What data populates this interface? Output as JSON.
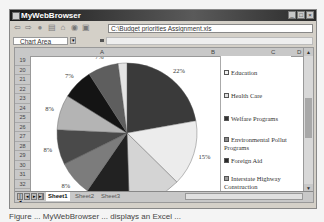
{
  "window": {
    "title": "MyWebBrowser",
    "minimize": "_",
    "maximize": "□",
    "close": "×"
  },
  "toolbar": {
    "icons": [
      "back-icon",
      "forward-icon",
      "stop-icon",
      "refresh-icon",
      "home-icon",
      "search-icon",
      "print-icon"
    ],
    "address": "C:\\Budget priorities Assignment.xls"
  },
  "formula_bar": {
    "name_box": "Chart Area",
    "formula": ""
  },
  "sheet": {
    "columns": [
      "A",
      "B",
      "C",
      "D"
    ],
    "rows": [
      "19",
      "20",
      "21",
      "22",
      "23",
      "24",
      "25",
      "26",
      "27",
      "28",
      "29",
      "30",
      "31",
      "32",
      "33",
      "34",
      "35"
    ],
    "tabs": [
      "Sheet1",
      "Sheet2",
      "Sheet3"
    ],
    "active_tab": "Sheet1"
  },
  "chart_data": {
    "type": "pie",
    "title": "",
    "slices": [
      {
        "label": "Education",
        "value": 22,
        "color": "#3a3a3a"
      },
      {
        "label": "Health Care",
        "value": 15,
        "color": "#ececec"
      },
      {
        "label": "Welfare Programs",
        "value": 12,
        "color": "#d4d4d4"
      },
      {
        "label": "Environmental Pollution Programs",
        "value": 10,
        "color": "#222222"
      },
      {
        "label": "Foreign Aid",
        "value": 8,
        "color": "#7c7c7c"
      },
      {
        "label": "Interstate Highway Construction",
        "value": 8,
        "color": "#4a4a4a"
      },
      {
        "label": "Space Research and Development",
        "value": 8,
        "color": "#b4b4b4"
      },
      {
        "label": "Other A",
        "value": 7,
        "color": "#141414"
      },
      {
        "label": "Other B",
        "value": 7,
        "color": "#5e5e5e"
      },
      {
        "label": "Other C",
        "value": 2,
        "color": "#e4e4e4"
      }
    ],
    "data_labels": [
      "22%",
      "15%",
      "12%",
      "",
      "8%",
      "8%",
      "8%",
      "7%",
      "7%",
      ""
    ],
    "legend": {
      "placement": "right",
      "entries": [
        {
          "label": "Education",
          "swatch": "#f0f0f0"
        },
        {
          "label": "Health Care",
          "swatch": "#e0e0e0"
        },
        {
          "label": "Welfare Programs",
          "swatch": "#333333"
        },
        {
          "label": "Environmental Pollut Programs",
          "swatch": "#888888"
        },
        {
          "label": "Foreign Aid",
          "swatch": "#2a2a2a"
        },
        {
          "label": "Interstate Highway Construction",
          "swatch": "#9a9a9a"
        },
        {
          "label": "Space Research and Development",
          "swatch": "#222222"
        }
      ]
    }
  },
  "caption": "Figure ... MyWebBrowser ... displays an Excel ..."
}
